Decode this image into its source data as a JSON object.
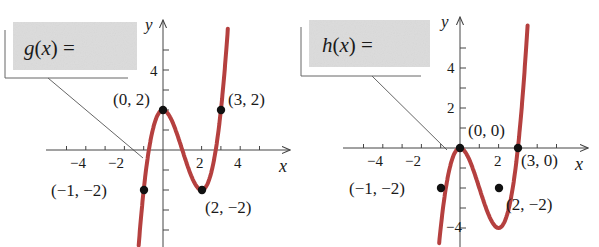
{
  "colors": {
    "curve": "#b5403f",
    "axis": "#444444",
    "point": "#111111",
    "label_box": "#dcdcdc",
    "callout": "#555555"
  },
  "chart_data": [
    {
      "type": "line",
      "title": "",
      "function_label": "g(x) =",
      "xlabel": "x",
      "ylabel": "y",
      "x_tick_labels": [
        "−4",
        "−2",
        "2",
        "4"
      ],
      "y_tick_labels": [
        "4"
      ],
      "xlim": [
        -5,
        5.5
      ],
      "ylim": [
        -5,
        6.5
      ],
      "points": [
        {
          "label": "(−1, −2)",
          "x": -1,
          "y": -2
        },
        {
          "label": "(0, 2)",
          "x": 0,
          "y": 2
        },
        {
          "label": "(2, −2)",
          "x": 2,
          "y": -2
        },
        {
          "label": "(3, 2)",
          "x": 3,
          "y": 2
        }
      ],
      "curve": "cubic through (−1,−2), (0,2), (2,−2), (3,2): g(x) = x^3 − 3x^2 + 2",
      "grid": false
    },
    {
      "type": "line",
      "title": "",
      "function_label": "h(x) =",
      "xlabel": "x",
      "ylabel": "y",
      "x_tick_labels": [
        "−4",
        "−2",
        "2"
      ],
      "y_tick_labels": [
        "4",
        "2",
        "−4"
      ],
      "xlim": [
        -5,
        5.5
      ],
      "ylim": [
        -5,
        6.5
      ],
      "points": [
        {
          "label": "(−1, −2)",
          "x": -1,
          "y": -2
        },
        {
          "label": "(0, 0)",
          "x": 0,
          "y": 0
        },
        {
          "label": "(2, −2)",
          "x": 2,
          "y": -2
        },
        {
          "label": "(3, 0)",
          "x": 3,
          "y": 0
        }
      ],
      "curve": "cubic through (−1,−2), (0,0), (2,−2), (3,0): h(x) = x^3 − 3x^2",
      "grid": false
    }
  ],
  "left": {
    "box_label": "g(x) =",
    "x_axis": "x",
    "y_axis": "y",
    "ticks_x": [
      "−4",
      "−2",
      "2",
      "4"
    ],
    "ticks_y": [
      "4"
    ],
    "points": [
      "(−1, −2)",
      "(0, 2)",
      "(2, −2)",
      "(3, 2)"
    ]
  },
  "right": {
    "box_label": "h(x) =",
    "x_axis": "x",
    "y_axis": "y",
    "ticks_x": [
      "−4",
      "−2",
      "2"
    ],
    "ticks_y": [
      "4",
      "2",
      "−4"
    ],
    "points": [
      "(−1, −2)",
      "(0, 0)",
      "(2, −2)",
      "(3, 0)"
    ]
  }
}
